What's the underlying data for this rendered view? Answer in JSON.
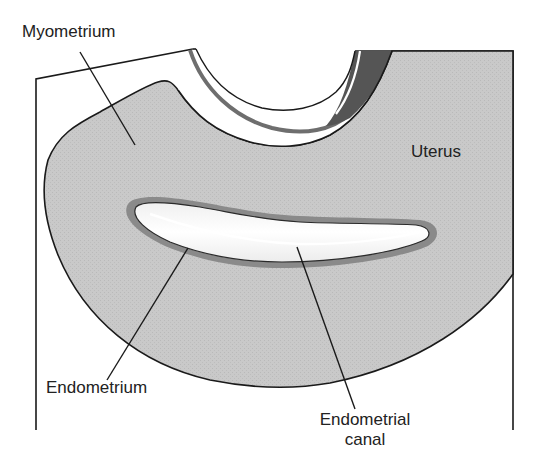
{
  "diagram": {
    "type": "anatomical-cross-section",
    "labels": {
      "myometrium": "Myometrium",
      "uterus": "Uterus",
      "endometrium": "Endometrium",
      "endometrial_canal_line1": "Endometrial",
      "endometrial_canal_line2": "canal"
    },
    "colors": {
      "uterus_fill": "#c8c8c8",
      "endometrium_band": "#8a8a8a",
      "canal_fill": "#f4f4f4",
      "outline": "#1a1a1a",
      "dark_wedge": "#555555",
      "background": "#ffffff"
    }
  }
}
